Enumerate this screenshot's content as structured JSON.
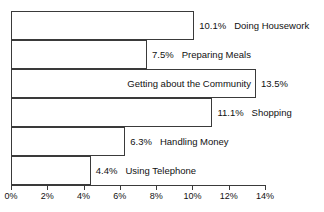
{
  "chart_data": {
    "type": "bar",
    "orientation": "horizontal",
    "title": "",
    "xlabel": "",
    "ylabel": "",
    "xlim": [
      0,
      14
    ],
    "grid": false,
    "legend": false,
    "unit": "%",
    "categories": [
      "Doing Housework",
      "Preparing Meals",
      "Getting about the Community",
      "Shopping",
      "Handling Money",
      "Using Telephone"
    ],
    "values": [
      10.1,
      7.5,
      13.5,
      11.1,
      6.3,
      4.4
    ],
    "value_labels": [
      "10.1%",
      "7.5%",
      "13.5%",
      "11.1%",
      "6.3%",
      "4.4%"
    ],
    "xticks": [
      0,
      2,
      4,
      6,
      8,
      10,
      12,
      14
    ],
    "xtick_labels": [
      "0%",
      "2%",
      "4%",
      "6%",
      "8%",
      "10%",
      "12%",
      "14%"
    ],
    "bars": [
      {
        "category": "Doing Housework",
        "value": 10.1,
        "value_label": "10.1%",
        "label_placement": "outside"
      },
      {
        "category": "Preparing Meals",
        "value": 7.5,
        "value_label": "7.5%",
        "label_placement": "outside"
      },
      {
        "category": "Getting about the Community",
        "value": 13.5,
        "value_label": "13.5%",
        "label_placement": "inside"
      },
      {
        "category": "Shopping",
        "value": 11.1,
        "value_label": "11.1%",
        "label_placement": "outside"
      },
      {
        "category": "Handling Money",
        "value": 6.3,
        "value_label": "6.3%",
        "label_placement": "outside"
      },
      {
        "category": "Using Telephone",
        "value": 4.4,
        "value_label": "4.4%",
        "label_placement": "outside"
      }
    ],
    "colors": {
      "bar_fill": "#ffffff",
      "bar_border": "#3a3a3a",
      "axis": "#3a3a3a",
      "text": "#111111",
      "background": "#ffffff"
    }
  }
}
